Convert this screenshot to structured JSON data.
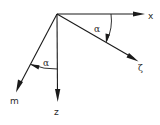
{
  "diagram": {
    "title": "",
    "origin": {
      "x": 57,
      "y": 14
    },
    "axes": [
      {
        "id": "x",
        "label": "x",
        "from": [
          57,
          14
        ],
        "to": [
          144,
          14
        ],
        "label_pos": [
          149,
          19
        ]
      },
      {
        "id": "l",
        "label": "ζ",
        "from": [
          57,
          14
        ],
        "to": [
          138,
          61
        ],
        "label_pos": [
          139,
          71
        ]
      },
      {
        "id": "z",
        "label": "z",
        "from": [
          57,
          14
        ],
        "to": [
          58,
          101
        ],
        "label_pos": [
          54,
          115
        ]
      },
      {
        "id": "m",
        "label": "m",
        "from": [
          57,
          14
        ],
        "to": [
          16,
          92
        ],
        "label_pos": [
          10,
          103
        ]
      }
    ],
    "angles": [
      {
        "id": "alpha-upper",
        "label": "α",
        "between": [
          "x",
          "l"
        ],
        "label_pos": [
          95,
          32
        ]
      },
      {
        "id": "alpha-lower",
        "label": "α",
        "between": [
          "z",
          "m"
        ],
        "label_pos": [
          43,
          66
        ]
      }
    ]
  }
}
